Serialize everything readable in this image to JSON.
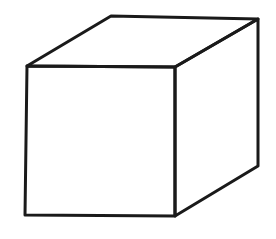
{
  "figure": {
    "stroke_color": "#1a1a1a",
    "background_color": "#ffffff",
    "stroke_width": 3,
    "vertices": {
      "front_top_left": [
        27,
        66
      ],
      "front_top_right": [
        175,
        67
      ],
      "front_bottom_left": [
        25,
        215
      ],
      "front_bottom_right": [
        175,
        216
      ],
      "back_top_left": [
        111,
        16
      ],
      "back_top_right": [
        258,
        19
      ],
      "back_bottom_right": [
        258,
        166
      ]
    }
  }
}
